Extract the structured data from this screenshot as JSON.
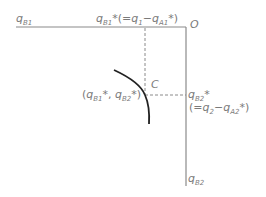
{
  "labels": {
    "qB1_axis": "q",
    "qB1_axis_sub": "B1",
    "qB1_star_q": "q",
    "qB1_star_sub": "B1",
    "qB1_star_rest": "*(=",
    "q1": "q",
    "q1_sub": "1",
    "minus1": "−",
    "qA1": "q",
    "qA1_sub": "A1",
    "close1": "*)",
    "origin": "O",
    "point_C": "C",
    "coord_open": "(",
    "coord_q1": "q",
    "coord_q1_sub": "B1",
    "coord_mid": "*, ",
    "coord_q2": "q",
    "coord_q2_sub": "B2",
    "coord_close": "*)",
    "qB2_star_q": "q",
    "qB2_star_sub": "B2",
    "qB2_star_mark": "*",
    "eq2_open": "(=",
    "q2": "q",
    "q2_sub": "2",
    "minus2": "−",
    "qA2": "q",
    "qA2_sub": "A2",
    "close2": "*)",
    "qB2_axis": "q",
    "qB2_axis_sub": "B2"
  },
  "colors": {
    "axis": "#8a8a8a",
    "dashed": "#8a8a8a",
    "curve": "#222222",
    "text": "#7a7a7a"
  }
}
